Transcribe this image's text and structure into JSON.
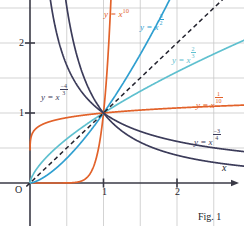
{
  "figure": {
    "caption": "Fig. 1",
    "origin_label": "O",
    "x_axis_label": "x",
    "colors": {
      "axis": "#3a3a46",
      "grid": "#c8c8c8",
      "navy": "#3c3c5a",
      "orange": "#e2622a",
      "blue": "#2f9fd0",
      "teal": "#5fc0cf",
      "dashed": "#23232e",
      "text_dark": "#1b1b28"
    }
  },
  "axes": {
    "x_ticks": [
      {
        "value": 1,
        "label": "1"
      },
      {
        "value": 2,
        "label": "2"
      }
    ],
    "y_ticks": [
      {
        "value": 1,
        "label": "1"
      },
      {
        "value": 2,
        "label": "2"
      }
    ],
    "gridlines_x": [
      0.5,
      1,
      1.5,
      2,
      2.5
    ],
    "gridlines_y": [
      0.5,
      1,
      1.5,
      2,
      2.5
    ],
    "xlim": [
      -0.42,
      2.95
    ],
    "ylim": [
      -0.6,
      3.15
    ],
    "grid": true
  },
  "chart_data": {
    "type": "line",
    "title": "Fig. 1",
    "xlabel": "x",
    "ylabel": "",
    "xlim": [
      -0.42,
      2.95
    ],
    "ylim": [
      -0.6,
      3.15
    ],
    "grid": true,
    "legend_position": "inline-annotations",
    "note": "Power functions y = x^a plotted on the first quadrant; all curves pass through the point (1, 1).",
    "common_point": [
      1,
      1
    ],
    "series": [
      {
        "name": "y = x^10",
        "exponent": 10,
        "color": "#e2622a",
        "label_text": "y = x",
        "label_exponent": "10",
        "label_kind": "integer",
        "label_x": 104,
        "label_y": 8,
        "label_color": "#e2622a"
      },
      {
        "name": "y = x^(3/2)",
        "exponent": 1.5,
        "color": "#2f9fd0",
        "label_text": "y = x",
        "label_num": "3",
        "label_den": "2",
        "label_kind": "fraction",
        "label_x": 140,
        "label_y": 14,
        "label_color": "#2f9fd0"
      },
      {
        "name": "y = x^(2/3)",
        "exponent": 0.6666666667,
        "color": "#5fc0cf",
        "label_text": "y = x",
        "label_num": "2",
        "label_den": "3",
        "label_kind": "fraction",
        "label_x": 172,
        "label_y": 47,
        "label_color": "#5fc0cf"
      },
      {
        "name": "y = x^(1/10)",
        "exponent": 0.1,
        "color": "#e2622a",
        "label_text": "y = x",
        "label_num": "1",
        "label_den": "10",
        "label_kind": "fraction",
        "label_x": 196,
        "label_y": 92,
        "label_color": "#e2622a"
      },
      {
        "name": "y = x^(-4/3)",
        "exponent": -1.3333333333,
        "color": "#3c3c5a",
        "label_text": "y = x",
        "label_sign": "−",
        "label_num": "4",
        "label_den": "3",
        "label_kind": "signed-fraction",
        "label_x": 41,
        "label_y": 84,
        "label_color": "#3c3c5a"
      },
      {
        "name": "y = x^(-3/4)",
        "exponent": -0.75,
        "color": "#3c3c5a",
        "label_text": "y = x",
        "label_sign": "−",
        "label_num": "3",
        "label_den": "4",
        "label_kind": "signed-fraction",
        "label_x": 194,
        "label_y": 129,
        "label_color": "#3c3c5a"
      },
      {
        "name": "y = x (dashed reference)",
        "exponent": 1,
        "color": "#23232e",
        "style": "dashed",
        "label_kind": "none"
      }
    ]
  }
}
